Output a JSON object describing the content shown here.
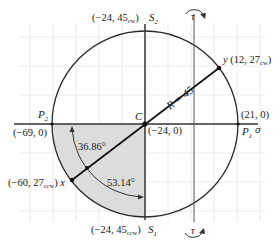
{
  "diagram": {
    "colors": {
      "circle": "#2a2a2a",
      "grid": "#e6e6e6",
      "shade": "#dcdcdc",
      "axis": "#333333"
    },
    "axes": {
      "sigma_label": "σ",
      "tau_label_top": "τ",
      "tau_label_bottom": "τ"
    },
    "center": {
      "label": "C",
      "coords": "(−24, 0)"
    },
    "radius_label": "R = 45",
    "points": {
      "P1": {
        "label": "P",
        "sub": "1",
        "coords": "(21, 0)"
      },
      "P2": {
        "label": "P",
        "sub": "2",
        "coords": "(−69, 0)"
      },
      "S1": {
        "label": "S",
        "sub": "1",
        "coords_prefix": "(−24, 45",
        "coords_sub": "ccw",
        "coords_suffix": ")"
      },
      "S2": {
        "label": "S",
        "sub": "2",
        "coords_prefix": "(−24, 45",
        "coords_sub": "cw",
        "coords_suffix": ")"
      },
      "x": {
        "label": "x",
        "coords_prefix": "(−60, 27",
        "coords_sub": "ccw",
        "coords_suffix": ")"
      },
      "y": {
        "label": "y",
        "coords_prefix": "(12, 27",
        "coords_sub": "cw",
        "coords_suffix": ")"
      }
    },
    "angles": {
      "a1": "36.86°",
      "a2": "53.14°"
    }
  }
}
